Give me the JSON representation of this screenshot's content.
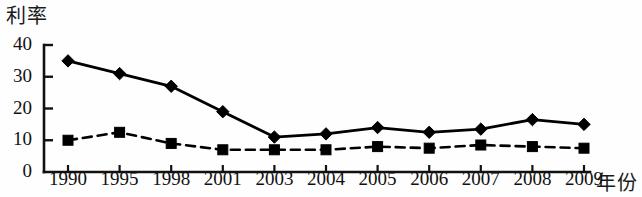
{
  "chart_data": {
    "type": "line",
    "title": "",
    "subtitle": "",
    "xlabel": "年份",
    "ylabel": "利率",
    "categories": [
      "1990",
      "1995",
      "1998",
      "2001",
      "2003",
      "2004",
      "2005",
      "2006",
      "2007",
      "2008",
      "2009"
    ],
    "ylim": [
      0,
      40
    ],
    "yticks": [
      0,
      10,
      20,
      30,
      40
    ],
    "ytick_labels": [
      "0",
      "10",
      "20",
      "30",
      "40"
    ],
    "grid": false,
    "legend": "none",
    "series": [
      {
        "name": "series-1",
        "marker": "diamond",
        "linestyle": "solid",
        "color": "#000000",
        "values": [
          35,
          31,
          27,
          19,
          11,
          12,
          14,
          12.5,
          13.5,
          16.5,
          15
        ]
      },
      {
        "name": "series-2",
        "marker": "square",
        "linestyle": "dashed",
        "color": "#000000",
        "values": [
          10,
          12.5,
          9,
          7,
          7,
          7,
          8,
          7.5,
          8.5,
          8,
          7.5
        ]
      }
    ],
    "annotations": []
  },
  "axes": {
    "y_title": "利率",
    "x_title": "年份"
  }
}
